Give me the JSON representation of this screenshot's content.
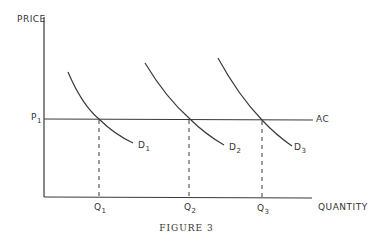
{
  "figure": {
    "caption": "FIGURE 3",
    "y_axis_label": "PRICE",
    "x_axis_label": "QUANTITY",
    "price_level": {
      "label": "P",
      "sub": "1"
    },
    "cost_line_label": "AC",
    "demand_curves": [
      {
        "label": "D",
        "sub": "1"
      },
      {
        "label": "D",
        "sub": "2"
      },
      {
        "label": "D",
        "sub": "3"
      }
    ],
    "quantities": [
      {
        "label": "Q",
        "sub": "1"
      },
      {
        "label": "Q",
        "sub": "2"
      },
      {
        "label": "Q",
        "sub": "3"
      }
    ],
    "line_color": "#3a3a3a"
  }
}
